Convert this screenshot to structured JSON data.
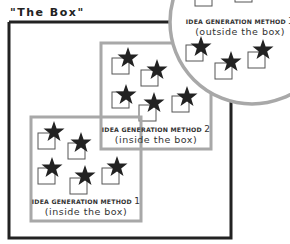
{
  "title": "\"The Box\"",
  "methods": [
    {
      "label": "IDEA GENERATION METHOD",
      "number": "1",
      "subtitle": "(inside the box)"
    },
    {
      "label": "IDEA GENERATION METHOD",
      "number": "2",
      "subtitle": "(inside the box)"
    },
    {
      "label": "IDEA GENERATION METHOD",
      "number": "3",
      "subtitle": "(outside the box)"
    }
  ],
  "colors": {
    "outer_box": "#222222",
    "inner_box": "#a8a8a8",
    "circle": "#a8a8a8",
    "star": "#222222",
    "square": "#555555"
  }
}
